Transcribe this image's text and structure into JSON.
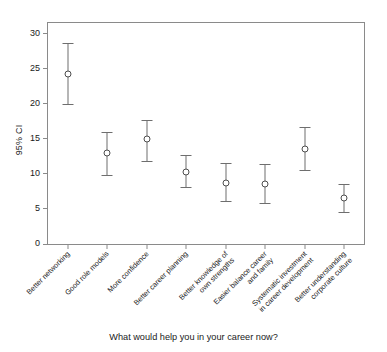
{
  "chart_data": {
    "type": "scatter",
    "title": "",
    "xlabel": "What would help you in your career now?",
    "ylabel": "95% CI",
    "ylim": [
      0,
      31.5
    ],
    "yticks": [
      0,
      5,
      10,
      15,
      20,
      25,
      30
    ],
    "ytick_labels": [
      "0",
      "5",
      "10",
      "15",
      "20",
      "25",
      "30"
    ],
    "grid": false,
    "legend": "none",
    "error_bar_style": "95% confidence interval with caps, open circle marker",
    "marker_color": "#4d4d4d",
    "line_color": "#6e6e6e",
    "axis_color": "#8a8a8a",
    "categories": [
      "Better networking",
      "Good role models",
      "More confidence",
      "Better career planning",
      "Better knowledge of\nown strengths",
      "Easier balance career\nand family",
      "Systematic investment\nin career development",
      "Better understanding\ncorporate culture"
    ],
    "values": [
      24.3,
      13.0,
      14.9,
      10.3,
      8.7,
      8.6,
      13.6,
      6.6
    ],
    "ci_lower": [
      19.9,
      9.9,
      11.8,
      8.1,
      6.1,
      5.9,
      10.5,
      4.6
    ],
    "ci_upper": [
      28.7,
      16.0,
      17.7,
      12.7,
      11.5,
      11.4,
      16.7,
      8.6
    ],
    "series": [
      {
        "name": "95% CI",
        "points": [
          {
            "category": "Better networking",
            "mean": 24.3,
            "lower": 19.9,
            "upper": 28.7
          },
          {
            "category": "Good role models",
            "mean": 13.0,
            "lower": 9.9,
            "upper": 16.0
          },
          {
            "category": "More confidence",
            "mean": 14.9,
            "lower": 11.8,
            "upper": 17.7
          },
          {
            "category": "Better career planning",
            "mean": 10.3,
            "lower": 8.1,
            "upper": 12.7
          },
          {
            "category": "Better knowledge of own strengths",
            "mean": 8.7,
            "lower": 6.1,
            "upper": 11.5
          },
          {
            "category": "Easier balance career and family",
            "mean": 8.6,
            "lower": 5.9,
            "upper": 11.4
          },
          {
            "category": "Systematic investment in career development",
            "mean": 13.6,
            "lower": 10.5,
            "upper": 16.7
          },
          {
            "category": "Better understanding corporate culture",
            "mean": 6.6,
            "lower": 4.6,
            "upper": 8.6
          }
        ]
      }
    ]
  },
  "axis": {
    "y_title": "95% CI",
    "x_caption": "What would help you in your career now?"
  }
}
